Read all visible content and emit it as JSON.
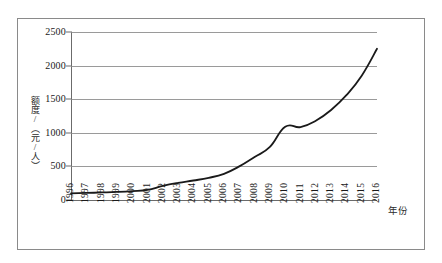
{
  "chart_data": {
    "type": "line",
    "title": "",
    "xlabel": "年份",
    "ylabel": "额度/（元/人）",
    "grid": true,
    "legend": false,
    "xlim": [
      1996,
      2016
    ],
    "ylim": [
      0,
      2500
    ],
    "yticks": [
      0,
      500,
      1000,
      1500,
      2000,
      2500
    ],
    "ytick_labels": [
      "0",
      "500",
      "1000",
      "1500",
      "2000",
      "2500"
    ],
    "categories": [
      "1996",
      "1997",
      "1998",
      "1999",
      "2000",
      "2001",
      "2002",
      "2003",
      "2004",
      "2005",
      "2006",
      "2007",
      "2008",
      "2009",
      "2010",
      "2011",
      "2012",
      "2013",
      "2014",
      "2015",
      "2016"
    ],
    "series": [
      {
        "name": "额度",
        "color": "#1a1a1a",
        "values": [
          100,
          105,
          112,
          120,
          132,
          150,
          210,
          255,
          290,
          330,
          390,
          500,
          640,
          790,
          1090,
          1085,
          1180,
          1340,
          1560,
          1850,
          2250
        ]
      }
    ]
  },
  "axes": {
    "y_title": "额度/（元/人）",
    "x_title": "年份"
  }
}
